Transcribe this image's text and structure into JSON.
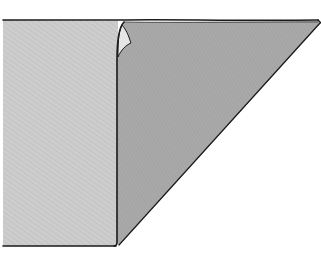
{
  "figure": {
    "title": "",
    "colors": {
      "background": "#ffffff",
      "light_panel": "#cdcdcd",
      "dark_panel": "#a9a9a9",
      "outline": "#1a1a1a",
      "curl_highlight": "#e6e6e6"
    },
    "parts": [
      {
        "id": "flat-panel",
        "label": ""
      },
      {
        "id": "folded-flap",
        "label": ""
      },
      {
        "id": "curled-corner",
        "label": ""
      }
    ]
  }
}
